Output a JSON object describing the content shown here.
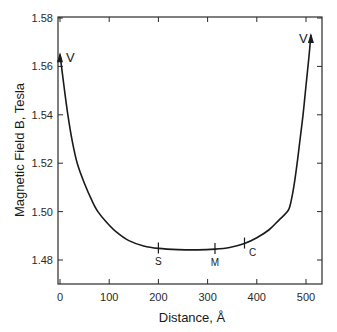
{
  "chart_data": {
    "type": "line",
    "title": "",
    "xlabel": "Distance, Å",
    "ylabel": "Magnetic Field B, Tesla",
    "xlim": [
      0,
      540
    ],
    "ylim": [
      1.47,
      1.58
    ],
    "x_ticks": [
      0,
      100,
      200,
      300,
      400,
      500
    ],
    "y_ticks": [
      1.48,
      1.5,
      1.52,
      1.54,
      1.56,
      1.58
    ],
    "x_tick_labels": [
      "0",
      "100",
      "200",
      "300",
      "400",
      "500"
    ],
    "y_tick_labels": [
      "1.48",
      "1.50",
      "1.52",
      "1.54",
      "1.56",
      "1.58"
    ],
    "grid": false,
    "legend": null,
    "series": [
      {
        "name": "B(distance)",
        "x": [
          0,
          8,
          16,
          25,
          35,
          50,
          65,
          77,
          95,
          115,
          140,
          170,
          200,
          240,
          280,
          315,
          345,
          375,
          400,
          425,
          445,
          460,
          467,
          475,
          482,
          488,
          494,
          498,
          502,
          506,
          510
        ],
        "y": [
          1.565,
          1.552,
          1.54,
          1.529,
          1.52,
          1.5115,
          1.5045,
          1.5,
          1.4955,
          1.4915,
          1.488,
          1.4858,
          1.4848,
          1.4843,
          1.4842,
          1.4845,
          1.4852,
          1.4868,
          1.4892,
          1.4925,
          1.4965,
          1.4995,
          1.502,
          1.51,
          1.52,
          1.53,
          1.54,
          1.548,
          1.556,
          1.564,
          1.573
        ]
      }
    ],
    "annotations": [
      {
        "label": "V",
        "x": 0,
        "y": 1.565,
        "note": "arrow at left end of curve"
      },
      {
        "label": "V",
        "x": 510,
        "y": 1.573,
        "note": "arrow at right end of curve"
      },
      {
        "label": "S",
        "x": 200,
        "y": 1.4848
      },
      {
        "label": "M",
        "x": 315,
        "y": 1.4845
      },
      {
        "label": "C",
        "x": 375,
        "y": 1.4868
      }
    ]
  },
  "labels": {
    "xlabel": "Distance, Å",
    "ylabel": "Magnetic Field B, Tesla"
  }
}
